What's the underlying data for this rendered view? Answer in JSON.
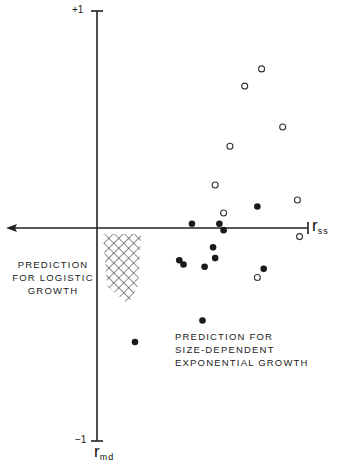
{
  "chart_data": {
    "type": "scatter",
    "title": "",
    "xlabel": "r_ss",
    "ylabel": "r_md",
    "xlim": [
      0,
      1
    ],
    "ylim": [
      -1,
      1
    ],
    "y_ticks": [
      "+1",
      "-1"
    ],
    "grid": false,
    "series": [
      {
        "name": "open circles",
        "marker": "open-circle",
        "points": [
          [
            0.78,
            0.74
          ],
          [
            0.7,
            0.66
          ],
          [
            0.88,
            0.47
          ],
          [
            0.63,
            0.38
          ],
          [
            0.56,
            0.2
          ],
          [
            0.95,
            0.13
          ],
          [
            0.6,
            0.07
          ],
          [
            0.96,
            -0.04
          ],
          [
            0.76,
            -0.23
          ]
        ]
      },
      {
        "name": "filled circles",
        "marker": "filled-circle",
        "points": [
          [
            0.76,
            0.1
          ],
          [
            0.45,
            0.02
          ],
          [
            0.58,
            0.02
          ],
          [
            0.6,
            -0.01
          ],
          [
            0.55,
            -0.09
          ],
          [
            0.56,
            -0.14
          ],
          [
            0.39,
            -0.15
          ],
          [
            0.41,
            -0.17
          ],
          [
            0.51,
            -0.18
          ],
          [
            0.79,
            -0.19
          ],
          [
            0.5,
            -0.43
          ],
          [
            0.18,
            -0.53
          ]
        ]
      }
    ],
    "annotations": [
      {
        "text": "PREDICTION FOR LOGISTIC GROWTH",
        "region": "cross-hatched area just below origin, r_ss 0.03-0.21, r_md 0 to -0.35"
      },
      {
        "text": "PREDICTION FOR SIZE-DEPENDENT EXPONENTIAL GROWTH",
        "region": "lower-right quadrant"
      }
    ]
  },
  "labels": {
    "y_top": "+1",
    "y_bottom": "−1",
    "x_axis_main": "r",
    "x_axis_sub": "ss",
    "y_axis_main": "r",
    "y_axis_sub": "md",
    "logistic": [
      "PREDICTION",
      "FOR LOGISTIC",
      "GROWTH"
    ],
    "exponential": [
      "PREDICTION FOR",
      "SIZE-DEPENDENT",
      "EXPONENTIAL GROWTH"
    ]
  }
}
